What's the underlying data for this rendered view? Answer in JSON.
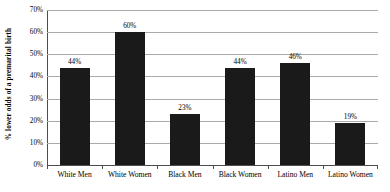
{
  "chart_data": {
    "type": "bar",
    "title": "",
    "xlabel": "",
    "ylabel": "% lower odds of a premarital birth",
    "ylim": [
      0,
      70
    ],
    "ytick_labels": [
      "70%",
      "60%",
      "50%",
      "40%",
      "30%",
      "20%",
      "10%",
      "0%"
    ],
    "ytick_values": [
      70,
      60,
      50,
      40,
      30,
      20,
      10,
      0
    ],
    "grid": true,
    "legend": false,
    "categories": [
      "White Men",
      "White Women",
      "Black Men",
      "Black Women",
      "Latino Men",
      "Latino Women"
    ],
    "values": [
      44,
      60,
      23,
      44,
      46,
      19
    ],
    "data_labels": [
      "44%",
      "60%",
      "23%",
      "44%",
      "46%",
      "19%"
    ],
    "bar_color": "#1a1a1a",
    "gridline_color": "#aaaaaa",
    "axis_color": "#4d4d4d",
    "background_color": "#ffffff"
  }
}
